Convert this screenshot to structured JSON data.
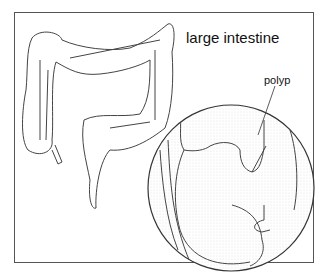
{
  "figure": {
    "title_label": "large intestine",
    "callout_label": "polyp",
    "colors": {
      "line": "#333333",
      "border": "#555555",
      "shade": "#bbbbbb",
      "background": "#ffffff"
    }
  }
}
